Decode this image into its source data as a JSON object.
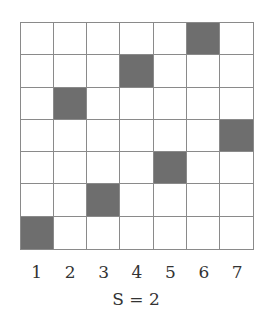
{
  "grid": {
    "rows": 7,
    "cols": 7,
    "filled": [
      {
        "row": 1,
        "col": 6
      },
      {
        "row": 2,
        "col": 4
      },
      {
        "row": 3,
        "col": 2
      },
      {
        "row": 4,
        "col": 7
      },
      {
        "row": 5,
        "col": 5
      },
      {
        "row": 6,
        "col": 3
      },
      {
        "row": 7,
        "col": 1
      }
    ],
    "fill_color": "#6e6e6e",
    "line_color": "#8a8a8a"
  },
  "column_labels": [
    "1",
    "2",
    "3",
    "4",
    "5",
    "6",
    "7"
  ],
  "caption": "S = 2"
}
